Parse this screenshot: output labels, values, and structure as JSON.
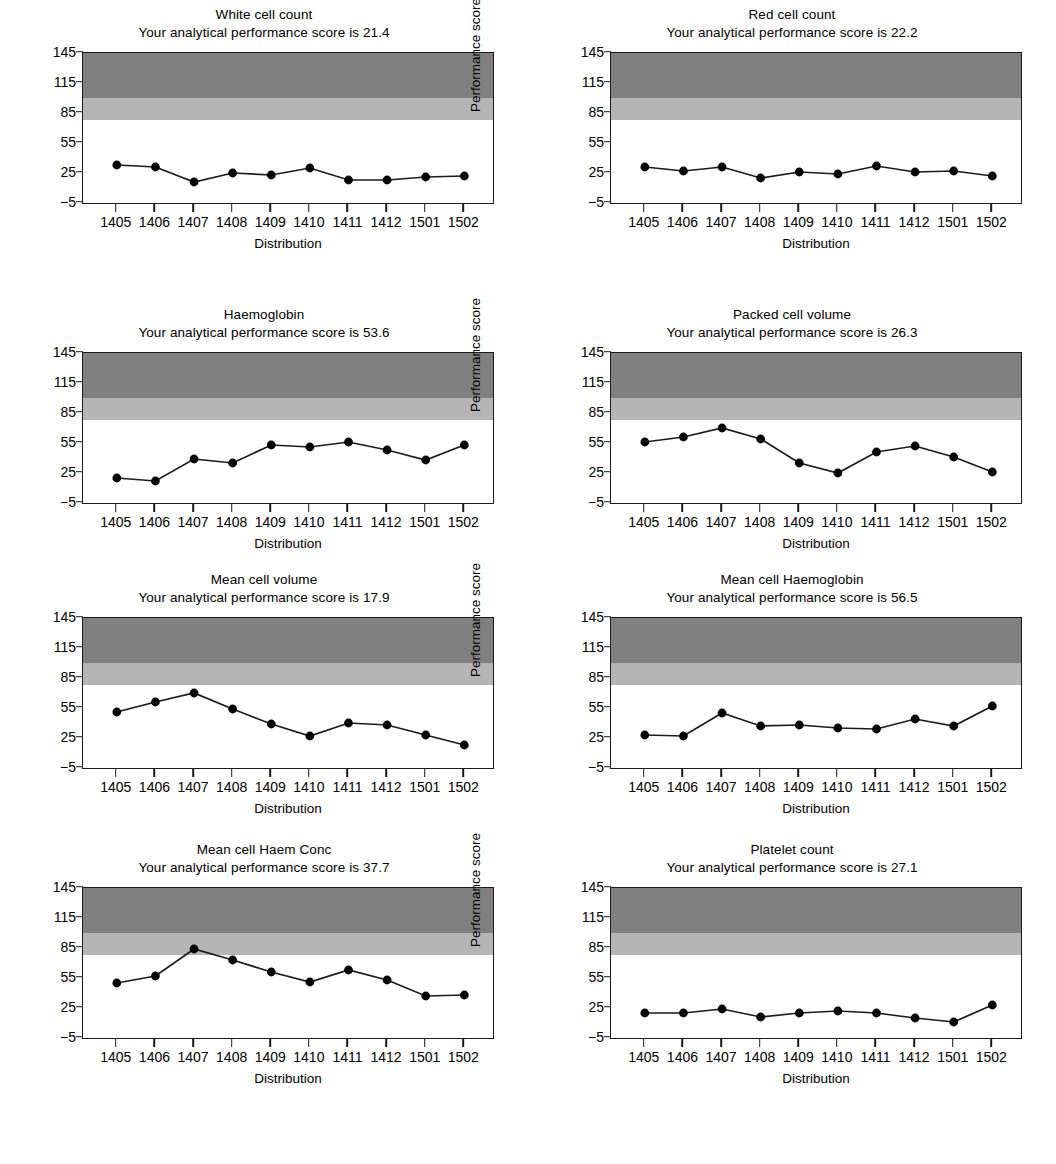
{
  "axis": {
    "ylabel": "Performance score",
    "xlabel": "Distribution",
    "yticks": [
      "145",
      "115",
      "85",
      "55",
      "25",
      "−5"
    ],
    "ytick_values": [
      145,
      115,
      85,
      55,
      25,
      -5
    ],
    "ylim": [
      -5,
      145
    ],
    "categories": [
      "1405",
      "1406",
      "1407",
      "1408",
      "1409",
      "1410",
      "1411",
      "1412",
      "1501",
      "1502"
    ],
    "bands": [
      {
        "name": "dark-band",
        "from": 100,
        "to": 145,
        "color": "#808080"
      },
      {
        "name": "light-band",
        "from": 78,
        "to": 100,
        "color": "#b5b5b5"
      }
    ]
  },
  "chart_data": [
    {
      "type": "line",
      "title": "White cell count",
      "subtitle": "Your analytical performance score is 21.4",
      "score": 21.4,
      "xlabel": "Distribution",
      "ylabel": "Performance score",
      "ylim": [
        -5,
        145
      ],
      "grid": false,
      "legend": "none",
      "categories": [
        "1405",
        "1406",
        "1407",
        "1408",
        "1409",
        "1410",
        "1411",
        "1412",
        "1501",
        "1502"
      ],
      "values": [
        33,
        31,
        16,
        25,
        23,
        30,
        18,
        18,
        21,
        22
      ]
    },
    {
      "type": "line",
      "title": "Red cell count",
      "subtitle": "Your analytical performance score is 22.2",
      "score": 22.2,
      "xlabel": "Distribution",
      "ylabel": "Performance score",
      "ylim": [
        -5,
        145
      ],
      "grid": false,
      "legend": "none",
      "categories": [
        "1405",
        "1406",
        "1407",
        "1408",
        "1409",
        "1410",
        "1411",
        "1412",
        "1501",
        "1502"
      ],
      "values": [
        31,
        27,
        31,
        20,
        26,
        24,
        32,
        26,
        27,
        22
      ]
    },
    {
      "type": "line",
      "title": "Haemoglobin",
      "subtitle": "Your analytical performance score is 53.6",
      "score": 53.6,
      "xlabel": "Distribution",
      "ylabel": "Performance score",
      "ylim": [
        -5,
        145
      ],
      "grid": false,
      "legend": "none",
      "categories": [
        "1405",
        "1406",
        "1407",
        "1408",
        "1409",
        "1410",
        "1411",
        "1412",
        "1501",
        "1502"
      ],
      "values": [
        20,
        17,
        39,
        35,
        53,
        51,
        56,
        48,
        38,
        53
      ]
    },
    {
      "type": "line",
      "title": "Packed cell volume",
      "subtitle": "Your analytical performance score is 26.3",
      "score": 26.3,
      "xlabel": "Distribution",
      "ylabel": "Performance score",
      "ylim": [
        -5,
        145
      ],
      "grid": false,
      "legend": "none",
      "categories": [
        "1405",
        "1406",
        "1407",
        "1408",
        "1409",
        "1410",
        "1411",
        "1412",
        "1501",
        "1502"
      ],
      "values": [
        56,
        61,
        70,
        59,
        35,
        25,
        46,
        52,
        41,
        26
      ]
    },
    {
      "type": "line",
      "title": "Mean cell volume",
      "subtitle": "Your analytical performance score is 17.9",
      "score": 17.9,
      "xlabel": "Distribution",
      "ylabel": "Performance score",
      "ylim": [
        -5,
        145
      ],
      "grid": false,
      "legend": "none",
      "categories": [
        "1405",
        "1406",
        "1407",
        "1408",
        "1409",
        "1410",
        "1411",
        "1412",
        "1501",
        "1502"
      ],
      "values": [
        51,
        61,
        70,
        54,
        39,
        27,
        40,
        38,
        28,
        18
      ]
    },
    {
      "type": "line",
      "title": "Mean cell Haemoglobin",
      "subtitle": "Your analytical performance score is 56.5",
      "score": 56.5,
      "xlabel": "Distribution",
      "ylabel": "Performance score",
      "ylim": [
        -5,
        145
      ],
      "grid": false,
      "legend": "none",
      "categories": [
        "1405",
        "1406",
        "1407",
        "1408",
        "1409",
        "1410",
        "1411",
        "1412",
        "1501",
        "1502"
      ],
      "values": [
        28,
        27,
        50,
        37,
        38,
        35,
        34,
        44,
        37,
        57
      ]
    },
    {
      "type": "line",
      "title": "Mean cell Haem Conc",
      "subtitle": "Your analytical performance score is 37.7",
      "score": 37.7,
      "xlabel": "Distribution",
      "ylabel": "Performance score",
      "ylim": [
        -5,
        145
      ],
      "grid": false,
      "legend": "none",
      "categories": [
        "1405",
        "1406",
        "1407",
        "1408",
        "1409",
        "1410",
        "1411",
        "1412",
        "1501",
        "1502"
      ],
      "values": [
        50,
        57,
        84,
        73,
        61,
        51,
        63,
        53,
        37,
        38
      ]
    },
    {
      "type": "line",
      "title": "Platelet count",
      "subtitle": "Your analytical performance score is 27.1",
      "score": 27.1,
      "xlabel": "Distribution",
      "ylabel": "Performance score",
      "ylim": [
        -5,
        145
      ],
      "grid": false,
      "legend": "none",
      "categories": [
        "1405",
        "1406",
        "1407",
        "1408",
        "1409",
        "1410",
        "1411",
        "1412",
        "1501",
        "1502"
      ],
      "values": [
        20,
        20,
        24,
        16,
        20,
        22,
        20,
        15,
        11,
        28
      ]
    }
  ],
  "style": {
    "line_color": "#1a1a1a",
    "marker_color": "#000000",
    "axis_color": "#1a1a1a",
    "plot_background": "#ffffff"
  }
}
